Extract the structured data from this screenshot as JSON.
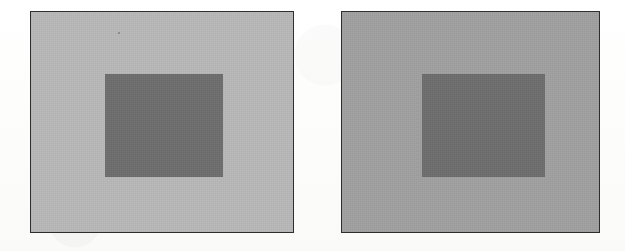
{
  "figure": {
    "background_color": "#fdfdfd",
    "width": 625,
    "height": 251,
    "panel_border_color": "#2e2e2e",
    "panel_border_width": 1.5,
    "speck": {
      "label": "scan-artifact-speck",
      "x": 118,
      "y": 32
    }
  },
  "panels": [
    {
      "id": "left",
      "name": "left-panel",
      "surround_label": "light gray surround",
      "surround_color": "#b9b9b9",
      "x": 30,
      "y": 11,
      "width": 264,
      "height": 222,
      "inner": {
        "name": "left-inner-square",
        "label": "test patch",
        "color": "#6e6e6e",
        "x": 74,
        "y": 62,
        "width": 118,
        "height": 103
      }
    },
    {
      "id": "right",
      "name": "right-panel",
      "surround_label": "dark gray surround",
      "surround_color": "#a1a1a1",
      "x": 341,
      "y": 11,
      "width": 259,
      "height": 222,
      "inner": {
        "name": "right-inner-square",
        "label": "test patch",
        "color": "#6e6e6e",
        "x": 80,
        "y": 62,
        "width": 123,
        "height": 103
      }
    }
  ]
}
